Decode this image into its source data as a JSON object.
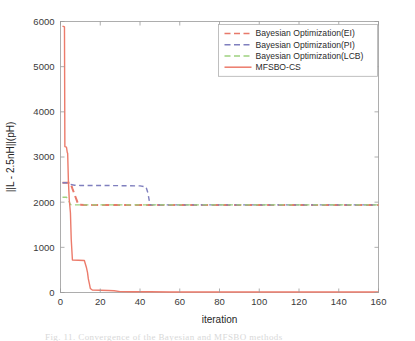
{
  "figure": {
    "background": "#ffffff",
    "caption_partial": "Fig. 11.  Convergence of the Bayesian and MFSBO methods"
  },
  "chart_data": {
    "type": "line",
    "title": "",
    "xlabel": "iteration",
    "ylabel": "||L - 2.5nH||(pH)",
    "xlim": [
      0,
      160
    ],
    "ylim": [
      0,
      6000
    ],
    "xticks": [
      0,
      20,
      40,
      60,
      80,
      100,
      120,
      140,
      160
    ],
    "yticks": [
      0,
      1000,
      2000,
      3000,
      4000,
      5000,
      6000
    ],
    "xtick_labels": [
      "0",
      "20",
      "40",
      "60",
      "80",
      "100",
      "120",
      "140",
      "160"
    ],
    "ytick_labels": [
      "0",
      "1000",
      "2000",
      "3000",
      "4000",
      "5000",
      "6000"
    ],
    "grid": false,
    "legend_position": "upper right",
    "series": [
      {
        "name": "Bayesian Optimization(EI)",
        "color": "#e8796a",
        "style": "dashed",
        "width": 2.0,
        "points": [
          [
            1,
            2430
          ],
          [
            3,
            2430
          ],
          [
            5,
            2430
          ],
          [
            6,
            2300
          ],
          [
            7,
            2180
          ],
          [
            8,
            2060
          ],
          [
            9,
            1945
          ],
          [
            12,
            1940
          ],
          [
            20,
            1940
          ],
          [
            40,
            1940
          ],
          [
            45,
            1940
          ],
          [
            60,
            1940
          ],
          [
            100,
            1940
          ],
          [
            130,
            1940
          ],
          [
            160,
            1940
          ]
        ]
      },
      {
        "name": "Bayesian Optimization(PI)",
        "color": "#7f7fbe",
        "style": "dashed",
        "width": 1.4,
        "points": [
          [
            1,
            2430
          ],
          [
            3,
            2430
          ],
          [
            5,
            2395
          ],
          [
            7,
            2375
          ],
          [
            10,
            2370
          ],
          [
            20,
            2370
          ],
          [
            30,
            2365
          ],
          [
            40,
            2360
          ],
          [
            43,
            2340
          ],
          [
            44,
            2200
          ],
          [
            45,
            1945
          ],
          [
            46,
            1940
          ],
          [
            60,
            1940
          ],
          [
            100,
            1940
          ],
          [
            160,
            1940
          ]
        ]
      },
      {
        "name": "Bayesian Optimization(LCB)",
        "color": "#9dd17f",
        "style": "dashed",
        "width": 1.4,
        "points": [
          [
            1,
            2110
          ],
          [
            3,
            2110
          ],
          [
            4,
            2050
          ],
          [
            5,
            1945
          ],
          [
            6,
            1940
          ],
          [
            10,
            1940
          ],
          [
            20,
            1940
          ],
          [
            45,
            1940
          ],
          [
            80,
            1940
          ],
          [
            120,
            1940
          ],
          [
            160,
            1940
          ]
        ]
      },
      {
        "name": "MFSBO-CS",
        "color": "#ec7b6b",
        "style": "solid",
        "width": 1.4,
        "points": [
          [
            1,
            5900
          ],
          [
            2,
            5880
          ],
          [
            2.2,
            3230
          ],
          [
            3,
            3220
          ],
          [
            3.4,
            3100
          ],
          [
            3.6,
            3080
          ],
          [
            4,
            2440
          ],
          [
            4.4,
            2060
          ],
          [
            5,
            1760
          ],
          [
            5.4,
            1180
          ],
          [
            6,
            720
          ],
          [
            9,
            715
          ],
          [
            12,
            710
          ],
          [
            13,
            560
          ],
          [
            13.6,
            440
          ],
          [
            14,
            300
          ],
          [
            14.6,
            180
          ],
          [
            15,
            90
          ],
          [
            16,
            55
          ],
          [
            20,
            50
          ],
          [
            24,
            45
          ],
          [
            27,
            40
          ],
          [
            30,
            20
          ],
          [
            36,
            18
          ],
          [
            45,
            15
          ],
          [
            55,
            12
          ],
          [
            57,
            10
          ],
          [
            60,
            10
          ],
          [
            100,
            10
          ],
          [
            160,
            10
          ]
        ]
      }
    ]
  },
  "legend": {
    "items": [
      {
        "label": "Bayesian Optimization(EI)",
        "color": "#e8796a",
        "style": "dashed"
      },
      {
        "label": "Bayesian Optimization(PI)",
        "color": "#7f7fbe",
        "style": "dashed"
      },
      {
        "label": "Bayesian Optimization(LCB)",
        "color": "#9dd17f",
        "style": "dashed"
      },
      {
        "label": "MFSBO-CS",
        "color": "#ec7b6b",
        "style": "solid"
      }
    ]
  }
}
